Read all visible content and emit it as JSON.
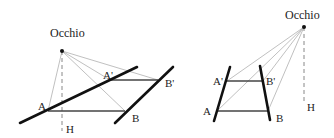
{
  "colors": {
    "thick": "#111111",
    "medium": "#444444",
    "ray": "#b0b0b0",
    "dashed": "#888888",
    "text": "#222222"
  },
  "diagrams": [
    {
      "id": "left",
      "eye": {
        "x": 62,
        "y": 51,
        "label": "Occhio",
        "label_x": 50,
        "label_y": 37
      },
      "foot": {
        "x": 62,
        "y": 131,
        "label": "H",
        "label_x": 66,
        "label_y": 133
      },
      "thick_lines": [
        {
          "x1": 20,
          "y1": 123,
          "x2": 137,
          "y2": 67
        },
        {
          "x1": 115,
          "y1": 123,
          "x2": 173,
          "y2": 67
        }
      ],
      "segments": [
        {
          "x1": 48,
          "y1": 111,
          "x2": 125,
          "y2": 111
        },
        {
          "x1": 110,
          "y1": 80,
          "x2": 158,
          "y2": 80
        }
      ],
      "points": [
        {
          "name": "A",
          "x": 48,
          "y": 111,
          "label": "A",
          "label_x": 38,
          "label_y": 110
        },
        {
          "name": "A'",
          "x": 110,
          "y": 80,
          "label": "A'",
          "label_x": 103,
          "label_y": 79
        },
        {
          "name": "B'",
          "x": 158,
          "y": 80,
          "label": "B'",
          "label_x": 165,
          "label_y": 87
        },
        {
          "name": "B",
          "x": 125,
          "y": 111,
          "label": "B",
          "label_x": 132,
          "label_y": 122
        }
      ]
    },
    {
      "id": "right",
      "eye": {
        "x": 304,
        "y": 27,
        "label": "Occhio",
        "label_x": 285,
        "label_y": 19
      },
      "foot": {
        "x": 304,
        "y": 104,
        "label": "H",
        "label_x": 307,
        "label_y": 111
      },
      "thick_lines": [
        {
          "x1": 214,
          "y1": 121,
          "x2": 230,
          "y2": 67
        },
        {
          "x1": 260,
          "y1": 66,
          "x2": 270,
          "y2": 120
        }
      ],
      "segments": [
        {
          "x1": 217,
          "y1": 111,
          "x2": 268,
          "y2": 111
        },
        {
          "x1": 227,
          "y1": 81,
          "x2": 263,
          "y2": 81
        }
      ],
      "points": [
        {
          "name": "A",
          "x": 217,
          "y": 111,
          "label": "A",
          "label_x": 203,
          "label_y": 115
        },
        {
          "name": "A'",
          "x": 227,
          "y": 81,
          "label": "A'",
          "label_x": 213,
          "label_y": 85
        },
        {
          "name": "B'",
          "x": 263,
          "y": 81,
          "label": "B'",
          "label_x": 266,
          "label_y": 85
        },
        {
          "name": "B",
          "x": 268,
          "y": 111,
          "label": "B",
          "label_x": 276,
          "label_y": 122
        }
      ]
    }
  ]
}
